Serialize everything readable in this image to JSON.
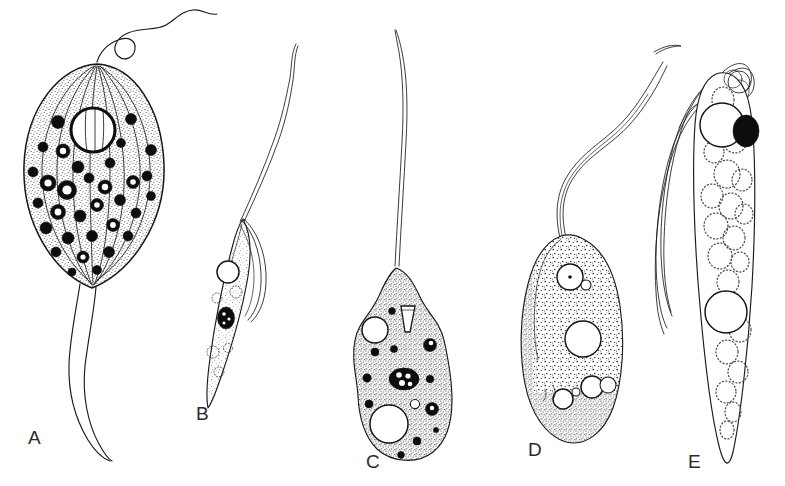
{
  "figure": {
    "kind": "scientific-line-drawing-plate",
    "medium": "ink stipple drawing",
    "background_color": "#ffffff",
    "ink_color": "#1a1a1a",
    "label_color": "#2b2b2b",
    "width": 785,
    "height": 486,
    "panel_count": 5
  },
  "panels": [
    {
      "id": "A",
      "label": "A",
      "label_x": 28,
      "label_y": 428,
      "shape": "broad pear-shaped / heart-shaped cell",
      "flagella_count": 1,
      "flagellum_description": "single long anterior flagellum that loops once near the apex then undulates up to the right",
      "body_description": "rounded body with many longitudinal ribs (striations) running apex to base, stippled cytoplasm",
      "nucleus": "large bold open circle in the upper centre, ribs visible behind it",
      "granules": "numerous dark spiky granules scattered across the body",
      "tail": "long tapering posterior tail extending down and curving right",
      "fill": "stippled"
    },
    {
      "id": "B",
      "label": "B",
      "label_x": 196,
      "label_y": 404,
      "shape": "narrow elongated spindle cell, tilted",
      "flagella_count": 1,
      "flagellum_description": "single very long flagellum running up and to the right",
      "body_description": "slim lance-shaped body with an undulating membrane along the upper-right margin",
      "nucleus": "small solid black oval in the mid body",
      "granules": "a few small pale ringed vesicles",
      "vacuole": "open circular vacuole near the anterior end",
      "fill": "lightly stippled"
    },
    {
      "id": "C",
      "label": "C",
      "label_x": 366,
      "label_y": 452,
      "shape": "pear-shaped / pyriform cell",
      "flagella_count": 1,
      "flagellum_description": "single very long straight anterior flagellum rising from the narrow apex",
      "body_description": "broad rounded body with heavily stippled cytoplasm and an irregular margin",
      "nucleus": "dark oval nucleus with pale inner granules at the centre",
      "granules": "many small dark dots plus several spiky dark granules",
      "vacuole": "two large open vacuoles, one upper-left and one larger lower-centre",
      "cytostome": "small pale funnel-shaped cytostome near the apex",
      "fill": "dense stipple"
    },
    {
      "id": "D",
      "label": "D",
      "label_x": 528,
      "label_y": 440,
      "shape": "oval / ovoid cell",
      "flagella_count": 1,
      "flagellum_description": "single thick ribbon-like flagellum that curves up and to the right in a broad S",
      "body_description": "plump oval body with coarse dark stipple, heaviest along the left and lower margins",
      "nucleus": "small open circle with a central dot near the anterior end",
      "granules": "fine dark flecks throughout the cytoplasm",
      "vacuole": "one large central open vacuole plus several smaller circles low in the body",
      "fill": "coarse stipple"
    },
    {
      "id": "E",
      "label": "E",
      "label_x": 688,
      "label_y": 452,
      "shape": "long slender spindle cell drawn to a fine posterior point",
      "flagella_count": 4,
      "flagellum_description": "a tuft of several long flagella arising from the apex, looping over the top and trailing down the left side",
      "body_description": "narrow elongate body outlined in clean line with no stipple",
      "nucleus": "solid black oval at the upper right, overlapping a bold open circle",
      "granules": "none",
      "vacuole": "two bold open circles, one anterior and one at mid body",
      "inclusions": "many pale dotted-outline vesicles filling the body",
      "fill": "open / unshaded with dotted vesicles"
    }
  ]
}
